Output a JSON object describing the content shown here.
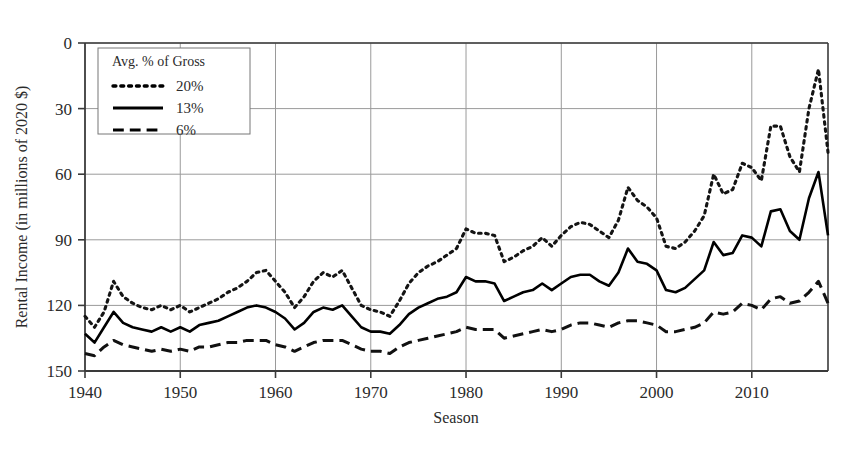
{
  "chart_data": {
    "type": "line",
    "title": "",
    "xlabel": "Season",
    "ylabel": "Rental Income (in millions of 2020 $)",
    "xlim": [
      1940,
      2018
    ],
    "ylim": [
      0,
      150
    ],
    "xticks": [
      1940,
      1950,
      1960,
      1970,
      1980,
      1990,
      2000,
      2010
    ],
    "yticks": [
      0,
      30,
      60,
      90,
      120,
      150
    ],
    "grid": "horizontal-and-vertical",
    "legend_position": "top-left-inside",
    "legend_title": "Avg. % of Gross",
    "x": [
      1940,
      1941,
      1942,
      1943,
      1944,
      1945,
      1946,
      1947,
      1948,
      1949,
      1950,
      1951,
      1952,
      1953,
      1954,
      1955,
      1956,
      1957,
      1958,
      1959,
      1960,
      1961,
      1962,
      1963,
      1964,
      1965,
      1966,
      1967,
      1968,
      1969,
      1970,
      1971,
      1972,
      1973,
      1974,
      1975,
      1976,
      1977,
      1978,
      1979,
      1980,
      1981,
      1982,
      1983,
      1984,
      1985,
      1986,
      1987,
      1988,
      1989,
      1990,
      1991,
      1992,
      1993,
      1994,
      1995,
      1996,
      1997,
      1998,
      1999,
      2000,
      2001,
      2002,
      2003,
      2004,
      2005,
      2006,
      2007,
      2008,
      2009,
      2010,
      2011,
      2012,
      2013,
      2014,
      2015,
      2016,
      2017,
      2018
    ],
    "series": [
      {
        "name": "20%",
        "style": "dotted",
        "color": "#141414",
        "values": [
          25,
          20,
          27,
          41,
          34,
          31,
          29,
          28,
          30,
          28,
          30,
          27,
          29,
          31,
          33,
          36,
          38,
          41,
          45,
          46,
          41,
          36,
          29,
          34,
          41,
          45,
          43,
          46,
          38,
          30,
          28,
          27,
          25,
          32,
          40,
          45,
          48,
          50,
          53,
          56,
          65,
          63,
          63,
          62,
          50,
          52,
          55,
          57,
          61,
          57,
          62,
          66,
          68,
          67,
          64,
          61,
          69,
          84,
          78,
          75,
          70,
          57,
          56,
          59,
          64,
          71,
          90,
          81,
          83,
          95,
          93,
          87,
          112,
          112,
          98,
          91,
          120,
          138,
          100
        ]
      },
      {
        "name": "13%",
        "style": "solid",
        "color": "#000000",
        "values": [
          17,
          13,
          20,
          27,
          22,
          20,
          19,
          18,
          20,
          18,
          20,
          18,
          21,
          22,
          23,
          25,
          27,
          29,
          30,
          29,
          27,
          24,
          19,
          22,
          27,
          29,
          28,
          30,
          25,
          20,
          18,
          18,
          17,
          21,
          26,
          29,
          31,
          33,
          34,
          36,
          43,
          41,
          41,
          40,
          32,
          34,
          36,
          37,
          40,
          37,
          40,
          43,
          44,
          44,
          41,
          39,
          45,
          56,
          50,
          49,
          46,
          37,
          36,
          38,
          42,
          46,
          59,
          53,
          54,
          62,
          61,
          57,
          73,
          74,
          64,
          60,
          79,
          91,
          62
        ]
      },
      {
        "name": "6%",
        "style": "dashed",
        "color": "#111111",
        "values": [
          8,
          7,
          11,
          14,
          12,
          11,
          10,
          9,
          10,
          9,
          10,
          9,
          11,
          11,
          12,
          13,
          13,
          14,
          14,
          14,
          12,
          11,
          9,
          11,
          13,
          14,
          14,
          14,
          12,
          10,
          9,
          9,
          8,
          11,
          13,
          14,
          15,
          16,
          17,
          18,
          20,
          19,
          19,
          19,
          15,
          16,
          17,
          18,
          19,
          18,
          19,
          21,
          22,
          22,
          21,
          20,
          22,
          23,
          23,
          22,
          21,
          18,
          18,
          19,
          20,
          22,
          27,
          26,
          27,
          31,
          30,
          28,
          33,
          34,
          31,
          32,
          36,
          41,
          31
        ]
      }
    ]
  },
  "axes": {
    "y_title": "Rental Income (in millions of 2020 $)",
    "x_title": "Season",
    "y_tick_labels": [
      "150",
      "120",
      "90",
      "60",
      "30",
      "0"
    ],
    "x_tick_labels": [
      "1940",
      "1950",
      "1960",
      "1970",
      "1980",
      "1990",
      "2000",
      "2010"
    ]
  },
  "legend": {
    "title": "Avg. % of Gross",
    "entries": [
      {
        "label": "20%",
        "style": "dotted"
      },
      {
        "label": "13%",
        "style": "solid"
      },
      {
        "label": "6%",
        "style": "dashed"
      }
    ]
  },
  "colors": {
    "line": "#000000",
    "grid": "#9a9a9a",
    "frame": "#3a3a3a",
    "background": "#ffffff",
    "text": "#2b2b2b"
  }
}
